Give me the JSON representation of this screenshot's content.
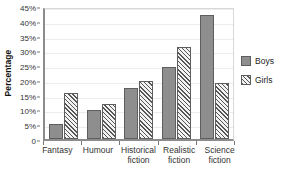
{
  "chart_data": {
    "type": "bar",
    "title": "",
    "xlabel": "",
    "ylabel": "Percentage",
    "ylim": [
      0,
      45
    ],
    "ytick_labels": [
      "0",
      "5%",
      "10%",
      "15%",
      "20%",
      "25%",
      "30%",
      "35%",
      "40%",
      "45%"
    ],
    "ytick_values": [
      0,
      5,
      10,
      15,
      20,
      25,
      30,
      35,
      40,
      45
    ],
    "grid": true,
    "legend_position": "right",
    "categories": [
      "Fantasy",
      "Humour",
      "Historical fiction",
      "Realistic fiction",
      "Science fiction"
    ],
    "category_lines": [
      [
        "Fantasy"
      ],
      [
        "Humour"
      ],
      [
        "Historical",
        "fiction"
      ],
      [
        "Realistic",
        "fiction"
      ],
      [
        "Science",
        "fiction"
      ]
    ],
    "series": [
      {
        "name": "Boys",
        "color": "#8e8e8e",
        "pattern": "solid",
        "values": [
          5,
          9.8,
          17.2,
          24.5,
          42
        ]
      },
      {
        "name": "Girls",
        "color": "#f2f2f2",
        "pattern": "diagonal-hatch",
        "values": [
          15.6,
          11.7,
          19.5,
          31.2,
          19
        ]
      }
    ]
  },
  "legend": {
    "items": [
      {
        "label": "Boys"
      },
      {
        "label": "Girls"
      }
    ]
  }
}
